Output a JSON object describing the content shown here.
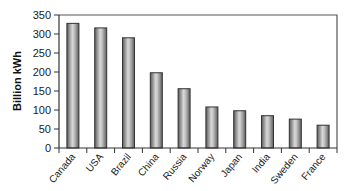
{
  "chart_data": {
    "type": "bar",
    "title": "",
    "xlabel": "",
    "ylabel": "Billion kWh",
    "ylim": [
      0,
      350
    ],
    "yticks": [
      0,
      50,
      100,
      150,
      200,
      250,
      300,
      350
    ],
    "grid": false,
    "legend": null,
    "categories": [
      "Canada",
      "USA",
      "Brazil",
      "China",
      "Russia",
      "Norway",
      "Japan",
      "India",
      "Sweden",
      "France"
    ],
    "values": [
      328,
      316,
      290,
      198,
      156,
      108,
      98,
      85,
      76,
      60
    ]
  },
  "style": {
    "bar_dark": "#5a5a5a",
    "bar_light": "#d8d8d8",
    "bar_outline": "#333333",
    "axis_color": "#333333",
    "frame_color": "#555555"
  }
}
